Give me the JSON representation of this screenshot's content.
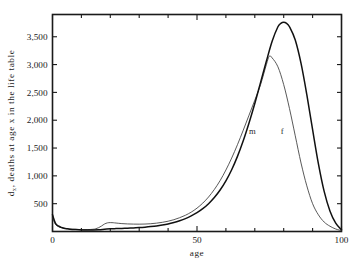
{
  "chart_data": {
    "type": "line",
    "title": "",
    "xlabel": "age",
    "ylabel": "d_x, deaths at age x in the life table",
    "ylabel_parts": {
      "main_prefix": "d",
      "subscript": "x",
      "main_suffix": ", deaths at age x in the life table"
    },
    "xlim": [
      0,
      100
    ],
    "ylim": [
      0,
      3900
    ],
    "grid": false,
    "legend_position": "inline-on-curves",
    "x_ticks_major": [
      0,
      50,
      100
    ],
    "x_tick_labels": [
      "0",
      "50",
      "100"
    ],
    "x_ticks_minor": [
      10,
      20,
      30,
      40,
      60,
      70,
      80,
      90
    ],
    "y_ticks": [
      500,
      1000,
      1500,
      2000,
      2500,
      3000,
      3500
    ],
    "y_tick_labels": [
      "500",
      "1,000",
      "1,500",
      "2,000",
      "2,500",
      "3,000",
      "3,500"
    ],
    "series": [
      {
        "name": "m",
        "label": "m",
        "label_x": 68,
        "label_y": 1760,
        "color": "#3b3b3b",
        "peak_x": 75,
        "peak_y": 3150,
        "x": [
          0,
          1,
          2,
          3,
          4,
          5,
          6,
          8,
          10,
          12,
          14,
          15,
          16,
          17,
          18,
          19,
          20,
          21,
          22,
          24,
          26,
          28,
          30,
          32,
          34,
          36,
          38,
          40,
          42,
          44,
          46,
          48,
          50,
          52,
          54,
          56,
          58,
          60,
          62,
          64,
          66,
          68,
          70,
          72,
          74,
          75,
          76,
          78,
          80,
          82,
          84,
          86,
          88,
          90,
          92,
          94,
          96,
          98,
          100
        ],
        "values": [
          250,
          130,
          90,
          70,
          58,
          50,
          44,
          38,
          34,
          34,
          40,
          50,
          70,
          100,
          135,
          155,
          160,
          158,
          152,
          142,
          136,
          133,
          132,
          134,
          140,
          150,
          165,
          185,
          212,
          248,
          292,
          348,
          420,
          510,
          620,
          755,
          915,
          1105,
          1320,
          1560,
          1820,
          2090,
          2360,
          2640,
          3000,
          3150,
          3120,
          2960,
          2640,
          2210,
          1720,
          1230,
          820,
          500,
          300,
          170,
          95,
          45,
          15
        ]
      },
      {
        "name": "f",
        "label": "f",
        "label_x": 79,
        "label_y": 1760,
        "color": "#111111",
        "peak_x": 80,
        "peak_y": 3760,
        "x": [
          0,
          1,
          2,
          3,
          4,
          5,
          6,
          8,
          10,
          12,
          14,
          16,
          18,
          20,
          22,
          24,
          26,
          28,
          30,
          32,
          34,
          36,
          38,
          40,
          42,
          44,
          46,
          48,
          50,
          52,
          54,
          56,
          58,
          60,
          62,
          64,
          66,
          68,
          70,
          72,
          74,
          76,
          78,
          79,
          80,
          81,
          82,
          84,
          86,
          88,
          90,
          92,
          94,
          96,
          98,
          100
        ],
        "values": [
          300,
          150,
          100,
          75,
          60,
          50,
          42,
          34,
          28,
          26,
          28,
          32,
          40,
          48,
          52,
          56,
          60,
          64,
          70,
          78,
          88,
          100,
          116,
          136,
          162,
          194,
          232,
          280,
          338,
          410,
          500,
          610,
          745,
          910,
          1110,
          1350,
          1630,
          1950,
          2300,
          2680,
          3060,
          3420,
          3680,
          3740,
          3760,
          3740,
          3680,
          3440,
          3020,
          2460,
          1830,
          1220,
          720,
          370,
          150,
          30
        ]
      }
    ]
  },
  "labels": {
    "x_axis_title": "age",
    "y_axis_title_prefix": "d",
    "y_axis_title_sub": "x",
    "y_axis_title_rest": ", deaths at age x in the life table"
  }
}
